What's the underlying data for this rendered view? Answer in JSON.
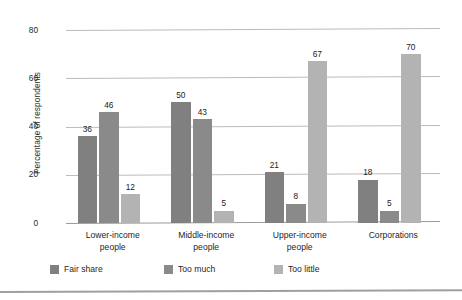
{
  "chart_data": {
    "type": "bar",
    "title": "",
    "xlabel": "",
    "ylabel": "Percentage of respondents",
    "ylim": [
      0,
      85
    ],
    "yticks": [
      0,
      20,
      40,
      60,
      80
    ],
    "ytick_labels": [
      "0",
      "20",
      "40",
      "60",
      "80"
    ],
    "grid": true,
    "legend_position": "bottom",
    "categories": [
      "Lower-income people",
      "Middle-income people",
      "Upper-income people",
      "Corporations"
    ],
    "category_lines": [
      [
        "Lower-income",
        "people"
      ],
      [
        "Middle-income",
        "people"
      ],
      [
        "Upper-income",
        "people"
      ],
      [
        "Corporations"
      ]
    ],
    "series": [
      {
        "name": "Fair share",
        "color": "#808080",
        "values": [
          36,
          50,
          21,
          18
        ]
      },
      {
        "name": "Too much",
        "color": "#8a8a8a",
        "values": [
          46,
          43,
          8,
          5
        ]
      },
      {
        "name": "Too little",
        "color": "#b3b3b3",
        "values": [
          12,
          5,
          67,
          70
        ]
      }
    ]
  },
  "legend": {
    "items": [
      {
        "label": "Fair share"
      },
      {
        "label": "Too much"
      },
      {
        "label": "Too little"
      }
    ]
  }
}
